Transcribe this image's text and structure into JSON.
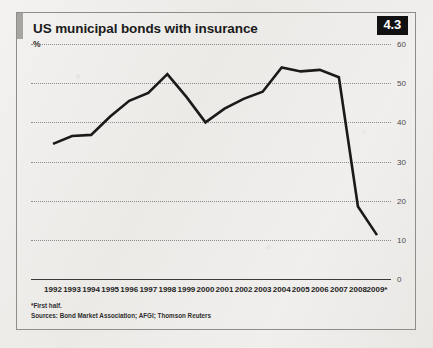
{
  "figure": {
    "title": "US municipal bonds with insurance",
    "unit": "%",
    "badge": "4.3",
    "footnote": "*First half.",
    "sources": "Sources: Bond Market Association; AFGI; Thomson Reuters"
  },
  "chart_data": {
    "type": "line",
    "title": "US municipal bonds with insurance",
    "xlabel": "",
    "ylabel": "%",
    "ylim": [
      0,
      60
    ],
    "yticks": [
      0,
      10,
      20,
      30,
      40,
      50,
      60
    ],
    "grid": true,
    "legend": false,
    "line_color": "#1a1a1a",
    "categories": [
      "1992",
      "1993",
      "1994",
      "1995",
      "1996",
      "1997",
      "1998",
      "1999",
      "2000",
      "2001",
      "2002",
      "2003",
      "2004",
      "2005",
      "2006",
      "2007",
      "2008",
      "2009*"
    ],
    "values": [
      34.5,
      36.5,
      36.8,
      41.5,
      45.5,
      47.5,
      52.3,
      46.5,
      40.0,
      43.5,
      46.0,
      47.8,
      54.0,
      53.0,
      53.4,
      51.5,
      18.5,
      11.2
    ],
    "annotations": [
      "*First half.",
      "Sources: Bond Market Association; AFGI; Thomson Reuters"
    ]
  }
}
